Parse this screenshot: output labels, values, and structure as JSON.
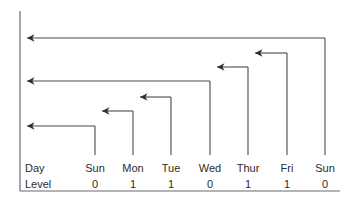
{
  "figure": {
    "kind": "recursion-level-trace-diagram",
    "background_color": "#ffffff",
    "line_color": "#4a4a4a",
    "axis_color": "#6b6b6b",
    "text_color": "#2b2b2b",
    "width": 348,
    "height": 203
  },
  "row_labels": {
    "day": "Day",
    "level": "Level"
  },
  "columns": [
    {
      "day": "Sun",
      "level": "0",
      "x": 95
    },
    {
      "day": "Mon",
      "level": "1",
      "x": 133
    },
    {
      "day": "Tue",
      "level": "1",
      "x": 171
    },
    {
      "day": "Wed",
      "level": "0",
      "x": 210
    },
    {
      "day": "Thur",
      "level": "1",
      "x": 248
    },
    {
      "day": "Fri",
      "level": "1",
      "x": 287
    },
    {
      "day": "Sun",
      "level": "0",
      "x": 325
    }
  ],
  "axis": {
    "left_x": 20,
    "top_y": 11,
    "bottom_y": 191,
    "baseline_y": 191,
    "baseline_x1": 20,
    "baseline_x2": 340
  },
  "arrows": [
    {
      "name": "sun7-to-axis",
      "from_x": 325,
      "to_x": 20,
      "y": 38,
      "drop_to_y": 155
    },
    {
      "name": "wed-to-axis",
      "from_x": 210,
      "to_x": 20,
      "y": 81,
      "drop_to_y": 155
    },
    {
      "name": "sun1-to-axis",
      "from_x": 95,
      "to_x": 20,
      "y": 126,
      "drop_to_y": 155
    },
    {
      "name": "fri-to-thur",
      "from_x": 287,
      "to_x": 248,
      "y": 53,
      "drop_to_y": 155
    },
    {
      "name": "thur-to-wed",
      "from_x": 248,
      "to_x": 210,
      "y": 67,
      "drop_to_y": 155
    },
    {
      "name": "tue-to-mon",
      "from_x": 171,
      "to_x": 133,
      "y": 97,
      "drop_to_y": 155
    },
    {
      "name": "mon-to-sun",
      "from_x": 133,
      "to_x": 95,
      "y": 111,
      "drop_to_y": 155
    }
  ],
  "text_rows": {
    "day_y": 172,
    "level_y": 188,
    "label_x": 25
  }
}
